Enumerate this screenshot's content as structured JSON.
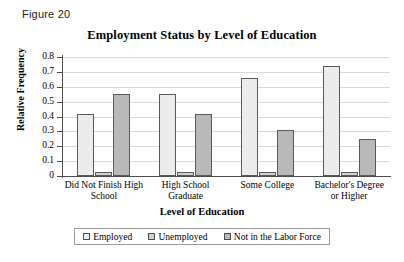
{
  "figure_label": "Figure 20",
  "chart_data": {
    "type": "bar",
    "title": "Employment Status by Level of Education",
    "xlabel": "Level of Education",
    "ylabel": "Relative Frequency",
    "ylim": [
      0,
      0.8
    ],
    "ytick_labels": [
      "0.8",
      "0.7",
      "0.6",
      "0.5",
      "0.4",
      "0.3",
      "0.2",
      "0.1",
      "0"
    ],
    "ytick_values": [
      0.8,
      0.7,
      0.6,
      0.5,
      0.4,
      0.3,
      0.2,
      0.1,
      0
    ],
    "grid": true,
    "legend_position": "bottom",
    "categories": [
      "Did Not Finish High School",
      "High School Graduate",
      "Some College",
      "Bachelor's Degree or Higher"
    ],
    "category_lines": [
      [
        "Did Not Finish High",
        "School"
      ],
      [
        "High School",
        "Graduate"
      ],
      [
        "Some College"
      ],
      [
        "Bachelor's Degree",
        "or Higher"
      ]
    ],
    "series": [
      {
        "name": "Employed",
        "color": "#ececec",
        "values": [
          0.42,
          0.55,
          0.66,
          0.74
        ]
      },
      {
        "name": "Unemployed",
        "color": "#d2d2d2",
        "values": [
          0.03,
          0.03,
          0.03,
          0.025
        ]
      },
      {
        "name": "Not in the Labor Force",
        "color": "#b9b9b9",
        "values": [
          0.55,
          0.42,
          0.31,
          0.25
        ]
      }
    ]
  }
}
